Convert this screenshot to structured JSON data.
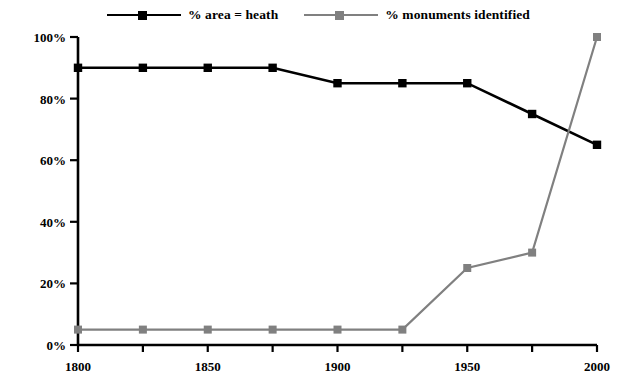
{
  "chart_data": {
    "type": "line",
    "title": "",
    "subtitle": "",
    "xlabel": "",
    "ylabel": "",
    "x": [
      1800,
      1825,
      1850,
      1875,
      1900,
      1925,
      1950,
      1975,
      2000
    ],
    "xlim": [
      1800,
      2000
    ],
    "ylim": [
      0,
      100
    ],
    "x_tick_values": [
      1800,
      1825,
      1850,
      1875,
      1900,
      1925,
      1950,
      1975,
      2000
    ],
    "x_tick_labels": [
      "1800",
      "",
      "1850",
      "",
      "1900",
      "",
      "1950",
      "",
      "2000"
    ],
    "y_ticks": [
      0,
      20,
      40,
      60,
      80,
      100
    ],
    "y_tick_labels": [
      "0%",
      "20%",
      "40%",
      "60%",
      "80%",
      "100%"
    ],
    "grid": false,
    "legend_position": "top-center",
    "series": [
      {
        "name": "% area = heath",
        "color": "#000000",
        "marker": "square",
        "values": [
          90,
          90,
          90,
          90,
          85,
          85,
          85,
          75,
          65
        ]
      },
      {
        "name": "% monuments identified",
        "color": "#808080",
        "marker": "square",
        "values": [
          5,
          5,
          5,
          5,
          5,
          5,
          25,
          30,
          100
        ]
      }
    ]
  },
  "axis": {
    "color": "#000000"
  }
}
